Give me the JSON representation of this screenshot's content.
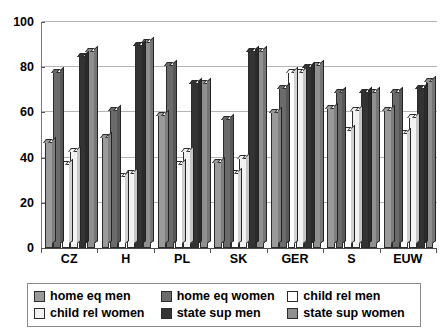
{
  "chart_data": {
    "type": "bar",
    "title": "",
    "subtitle": "",
    "xlabel": "",
    "ylabel": "",
    "ylim": [
      0,
      100
    ],
    "yticks": [
      0,
      20,
      40,
      60,
      80,
      100
    ],
    "ytick_labels": [
      "0",
      "20",
      "40",
      "60",
      "80",
      "100"
    ],
    "grid": true,
    "legend_position": "bottom",
    "categories": [
      "CZ",
      "H",
      "PL",
      "SK",
      "GER",
      "S",
      "EUW"
    ],
    "series": [
      {
        "name": "home eq men",
        "color": "#9a9a9a",
        "values": [
          47,
          49,
          59,
          38,
          60,
          62,
          61
        ]
      },
      {
        "name": "home eq women",
        "color": "#6b6b6b",
        "values": [
          78,
          61,
          81,
          57,
          71,
          69,
          69
        ]
      },
      {
        "name": "child rel men",
        "color": "#ffffff",
        "values": [
          37,
          32,
          37,
          33,
          78,
          52,
          51
        ]
      },
      {
        "name": "child rel women",
        "color": "#f2f2f2",
        "values": [
          43,
          33,
          43,
          40,
          78,
          61,
          58
        ]
      },
      {
        "name": "state sup men",
        "color": "#333333",
        "values": [
          85,
          90,
          73,
          87,
          80,
          69,
          71
        ]
      },
      {
        "name": "state sup women",
        "color": "#909090",
        "values": [
          87,
          91,
          73,
          87,
          81,
          69,
          74
        ]
      }
    ]
  },
  "legend": {
    "items": [
      {
        "label": "home eq men",
        "color": "#9a9a9a"
      },
      {
        "label": "home eq women",
        "color": "#6b6b6b"
      },
      {
        "label": "child rel men",
        "color": "#ffffff"
      },
      {
        "label": "child rel women",
        "color": "#f2f2f2"
      },
      {
        "label": "state sup men",
        "color": "#333333"
      },
      {
        "label": "state sup women",
        "color": "#909090"
      }
    ]
  }
}
